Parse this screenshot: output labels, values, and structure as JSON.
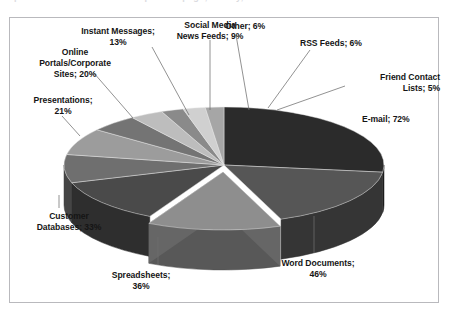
{
  "figure": {
    "frame_border_color": "#b9b9bd",
    "background": "#ffffff",
    "clipped_header_text": "placed in a nutshell of the top of the page; survey, 2010"
  },
  "chart_data": {
    "type": "pie",
    "title": "",
    "subtitle": "",
    "xlabel": "",
    "ylabel": "",
    "three_d": true,
    "legend_position": "none",
    "grid": false,
    "label_format": "{category}; {value}%",
    "note": "Percentages are multi-response shares and total 267%; slice angles are proportional.",
    "total_percent": 267,
    "categories": [
      "E-mail",
      "Word Documents",
      "Spreadsheets",
      "Customer Databases",
      "Presentations",
      "Online Portals/Corporate Sites",
      "Instant Messages",
      "Social Media News Feeds",
      "Other",
      "RSS Feeds",
      "Friend Contact Lists"
    ],
    "values": [
      72,
      46,
      36,
      33,
      21,
      20,
      13,
      9,
      6,
      6,
      5
    ],
    "units": "%",
    "colors": [
      "#2b2b2b",
      "#565656",
      "#8e8e8e",
      "#4a4a4a",
      "#6f6f6f",
      "#9c9c9c",
      "#747474",
      "#bdbdbd",
      "#8a8a8a",
      "#d0d0d0",
      "#a6a6a6"
    ],
    "slices": [
      {
        "label": "E-mail",
        "value": 72,
        "value_text": "72%",
        "text": "E-mail; 72%",
        "color": "#2b2b2b",
        "exploded": false
      },
      {
        "label": "Word Documents",
        "value": 46,
        "value_text": "46%",
        "text": "Word Documents; 46%",
        "color": "#565656",
        "exploded": false
      },
      {
        "label": "Spreadsheets",
        "value": 36,
        "value_text": "36%",
        "text": "Spreadsheets; 36%",
        "color": "#8e8e8e",
        "exploded": true
      },
      {
        "label": "Customer Databases",
        "value": 33,
        "value_text": "33%",
        "text": "Customer Databases; 33%",
        "color": "#4a4a4a",
        "exploded": false
      },
      {
        "label": "Presentations",
        "value": 21,
        "value_text": "21%",
        "text": "Presentations; 21%",
        "color": "#6f6f6f",
        "exploded": false
      },
      {
        "label": "Online Portals/Corporate Sites",
        "value": 20,
        "value_text": "20%",
        "text": "Online Portals/Corporate Sites; 20%",
        "color": "#9c9c9c",
        "exploded": false
      },
      {
        "label": "Instant Messages",
        "value": 13,
        "value_text": "13%",
        "text": "Instant Messages; 13%",
        "color": "#747474",
        "exploded": false
      },
      {
        "label": "Social Media News Feeds",
        "value": 9,
        "value_text": "9%",
        "text": "Social Media News Feeds; 9%",
        "color": "#bdbdbd",
        "exploded": false
      },
      {
        "label": "Other",
        "value": 6,
        "value_text": "6%",
        "text": "Other; 6%",
        "color": "#8a8a8a",
        "exploded": false
      },
      {
        "label": "RSS Feeds",
        "value": 6,
        "value_text": "6%",
        "text": "RSS Feeds; 6%",
        "color": "#d0d0d0",
        "exploded": false
      },
      {
        "label": "Friend Contact Lists",
        "value": 5,
        "value_text": "5%",
        "text": "Friend Contact Lists; 5%",
        "color": "#a6a6a6",
        "exploded": false
      }
    ]
  },
  "labels": {
    "instant_messages": {
      "line1": "Instant Messages;",
      "line2": "13%"
    },
    "social_media": {
      "line1": "Social Media",
      "line2": "News Feeds; 9%"
    },
    "other": {
      "line1": "Other; 6%"
    },
    "rss_feeds": {
      "line1": "RSS Feeds; 6%"
    },
    "friend_contact": {
      "line1": "Friend Contact",
      "line2": "Lists; 5%"
    },
    "email": {
      "line1": "E-mail; 72%"
    },
    "online_portals": {
      "line1": "Online",
      "line2": "Portals/Corporate",
      "line3": "Sites; 20%"
    },
    "presentations": {
      "line1": "Presentations;",
      "line2": "21%"
    },
    "customer_db": {
      "line1": "Customer",
      "line2": "Databases; 33%"
    },
    "spreadsheets": {
      "line1": "Spreadsheets;",
      "line2": "36%"
    },
    "word_documents": {
      "line1": "Word Documents;",
      "line2": "46%"
    }
  }
}
